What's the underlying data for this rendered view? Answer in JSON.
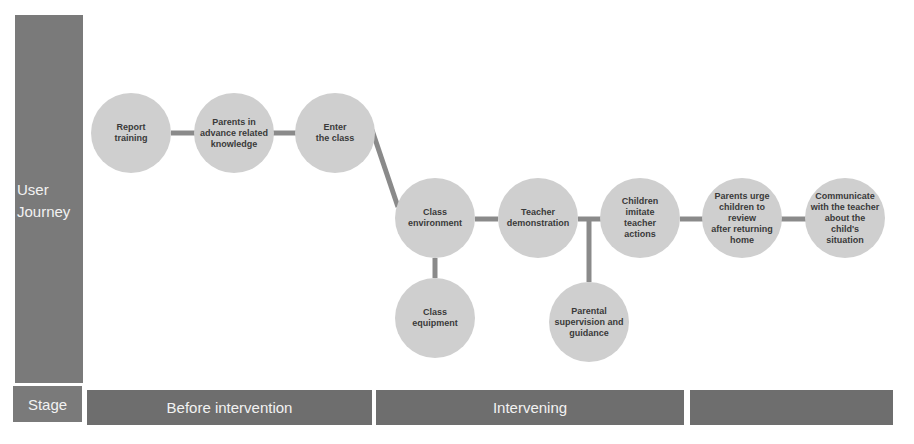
{
  "side": {
    "label": "User\nJourney",
    "label_line1": "User",
    "label_line2": "Journey"
  },
  "stage": {
    "label": "Stage",
    "segments": [
      {
        "label": "Before intervention"
      },
      {
        "label": "Intervening"
      },
      {
        "label": ""
      }
    ]
  },
  "nodes": [
    {
      "id": "report-training",
      "label": "Report\ntraining"
    },
    {
      "id": "parents-knowledge",
      "label": "Parents in\nadvance related\nknowledge"
    },
    {
      "id": "enter-class",
      "label": "Enter\nthe class"
    },
    {
      "id": "class-environment",
      "label": "Class\nenvironment"
    },
    {
      "id": "teacher-demonstration",
      "label": "Teacher\ndemonstration"
    },
    {
      "id": "children-imitate",
      "label": "Children\nimitate\nteacher\nactions"
    },
    {
      "id": "parents-urge",
      "label": "Parents urge\nchildren to\nreview\nafter returning\nhome"
    },
    {
      "id": "communicate-teacher",
      "label": "Communicate\nwith the teacher\nabout the\nchild's\nsituation"
    },
    {
      "id": "class-equipment",
      "label": "Class\nequipment"
    },
    {
      "id": "parental-supervision",
      "label": "Parental\nsupervision and\nguidance"
    }
  ],
  "colors": {
    "bar": "#7a7a7a",
    "node": "#cfcfcf",
    "connector": "#8a8a8a",
    "label": "#f2f2f2"
  }
}
